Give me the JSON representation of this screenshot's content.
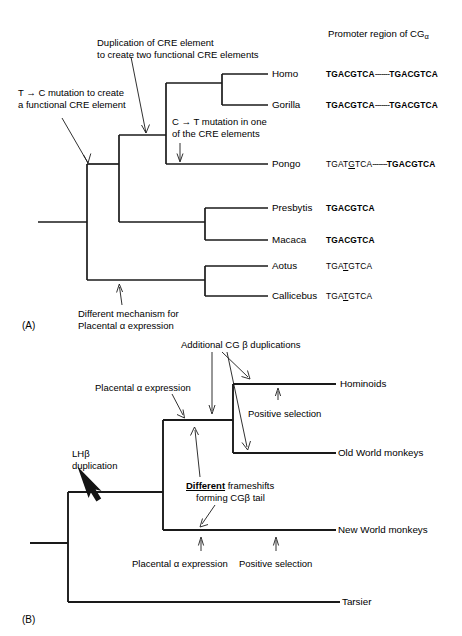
{
  "figure": {
    "panel_a_label": "(A)",
    "panel_b_label": "(B)"
  },
  "panel_a": {
    "header": "Promoter region of CG",
    "header_subscript": "α",
    "tips": [
      {
        "name": "Homo",
        "label": "Homo"
      },
      {
        "name": "Gorilla",
        "label": "Gorilla"
      },
      {
        "name": "Pongo",
        "label": "Pongo"
      },
      {
        "name": "Presbytis",
        "label": "Presbytis"
      },
      {
        "name": "Macaca",
        "label": "Macaca"
      },
      {
        "name": "Aotus",
        "label": "Aotus"
      },
      {
        "name": "Callicebus",
        "label": "Callicebus"
      }
    ],
    "sequences": [
      {
        "taxon": "Homo",
        "pre": "TGACGTCA",
        "spacer": "-------",
        "post": "TGACGTCA",
        "pre_bold": true,
        "post_bold": true,
        "underline_index": -1
      },
      {
        "taxon": "Gorilla",
        "pre": "TGACGTCA",
        "spacer": "-------",
        "post": "TGACGTCA",
        "pre_bold": true,
        "post_bold": true,
        "underline_index": -1
      },
      {
        "taxon": "Pongo",
        "pre": "TGATGTCA",
        "spacer": "-------",
        "post": "TGACGTCA",
        "pre_bold": false,
        "post_bold": true,
        "underline_index": 4
      },
      {
        "taxon": "Presbytis",
        "pre": "TGACGTCA",
        "spacer": "",
        "post": "",
        "pre_bold": true,
        "post_bold": false,
        "underline_index": -1
      },
      {
        "taxon": "Macaca",
        "pre": "TGACGTCA",
        "spacer": "",
        "post": "",
        "pre_bold": true,
        "post_bold": false,
        "underline_index": -1
      },
      {
        "taxon": "Aotus",
        "pre": "TGATGTCA",
        "spacer": "",
        "post": "",
        "pre_bold": false,
        "post_bold": false,
        "underline_index": 3
      },
      {
        "taxon": "Callicebus",
        "pre": "TGATGTCA",
        "spacer": "",
        "post": "",
        "pre_bold": false,
        "post_bold": false,
        "underline_index": 3
      }
    ],
    "annotations": {
      "duplication_cre": "Duplication of CRE element\nto create two functional CRE elements",
      "duplication_cre_line1": "Duplication of CRE element",
      "duplication_cre_line2": "to create two functional CRE elements",
      "t_to_c_line1": "T → C mutation to create",
      "t_to_c_line2": "a functional CRE element",
      "c_to_t_line1": "C → T mutation in one",
      "c_to_t_line2": "of the CRE elements",
      "diff_mech_line1": "Different mechanism for",
      "diff_mech_line2": "Placental α expression"
    }
  },
  "panel_b": {
    "tips": [
      {
        "name": "Hominoids",
        "label": "Hominoids"
      },
      {
        "name": "OldWorldMonkeys",
        "label": "Old World monkeys"
      },
      {
        "name": "NewWorldMonkeys",
        "label": "New World monkeys"
      },
      {
        "name": "Tarsier",
        "label": "Tarsier"
      }
    ],
    "annotations": {
      "additional_cg_beta": "Additional CG β duplications",
      "placental_alpha_upper": "Placental α expression",
      "lhb_line1": "LHβ",
      "lhb_line2": "duplication",
      "different_word": "Different",
      "frameshifts_rest": " frameshifts",
      "frameshifts_line2": "forming CGβ tail",
      "positive_selection_upper": "Positive selection",
      "placental_alpha_lower": "Placental α expression",
      "positive_selection_lower": "Positive selection"
    }
  },
  "style": {
    "line_color": "#1a1a1a",
    "text_color": "#000000",
    "background": "#ffffff"
  }
}
